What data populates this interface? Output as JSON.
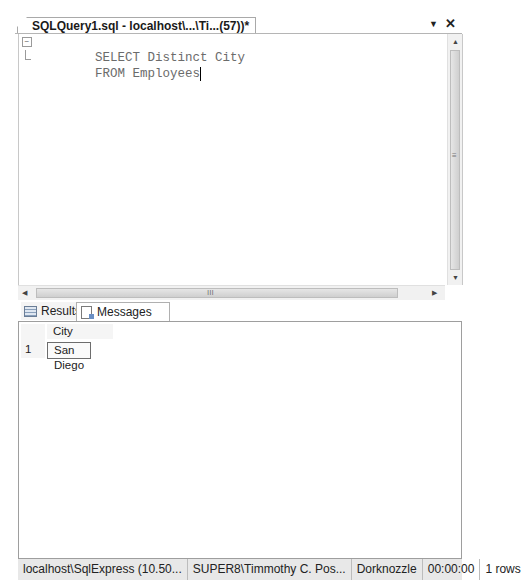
{
  "document_tab": {
    "title": "SQLQuery1.sql - localhost\\...\\Ti...(57))*",
    "dropdown_icon": "▼",
    "close_icon": "✕"
  },
  "editor": {
    "lines": [
      "SELECT Distinct City",
      "FROM Employees"
    ],
    "fold_expanded_glyph": "−"
  },
  "scrollbars": {
    "up": "▲",
    "down": "▼",
    "left": "◀",
    "right": "▶",
    "grip_h": "III",
    "grip_v": "≡"
  },
  "result_tabs": [
    {
      "label": "Results",
      "icon": "grid-icon"
    },
    {
      "label": "Messages",
      "icon": "messages-icon"
    }
  ],
  "grid": {
    "columns": [
      "City"
    ],
    "rows": [
      {
        "num": "1",
        "cells": [
          "San Diego"
        ]
      }
    ]
  },
  "status": {
    "server": "localhost\\SqlExpress (10.50...",
    "user": "SUPER8\\Timmothy C. Pos...",
    "database": "Dorknozzle",
    "elapsed": "00:00:00",
    "rows": "1 rows"
  }
}
